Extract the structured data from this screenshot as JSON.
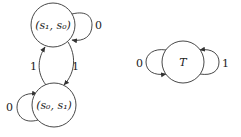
{
  "diagram": {
    "type": "state-machine",
    "nodes": [
      {
        "id": "s1s0",
        "label": "(s₁, s₀)",
        "cx": 53,
        "cy": 25,
        "r": 22
      },
      {
        "id": "s0s1",
        "label": "(s₀, s₁)",
        "cx": 54,
        "cy": 105,
        "r": 22
      },
      {
        "id": "T",
        "label": "T",
        "cx": 183,
        "cy": 62,
        "r": 21
      }
    ],
    "edges": [
      {
        "from": "s1s0",
        "to": "s1s0",
        "label": "0",
        "kind": "self-loop-right"
      },
      {
        "from": "s1s0",
        "to": "s0s1",
        "label": "1",
        "kind": "right-curve"
      },
      {
        "from": "s0s1",
        "to": "s1s0",
        "label": "1",
        "kind": "left-curve"
      },
      {
        "from": "s0s1",
        "to": "s0s1",
        "label": "0",
        "kind": "self-loop-left"
      },
      {
        "from": "T",
        "to": "T",
        "label": "0",
        "kind": "self-loop-left"
      },
      {
        "from": "T",
        "to": "T",
        "label": "1",
        "kind": "self-loop-right"
      }
    ]
  }
}
